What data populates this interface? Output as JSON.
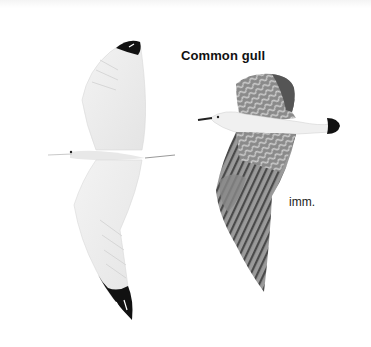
{
  "page": {
    "title": "Common gull",
    "figures": [
      {
        "id": "adult-underside",
        "description": "Gull in flight seen from below, pale wings with black wingtips",
        "icon": "gull-adult-underside-illustration"
      },
      {
        "id": "immature-upperside",
        "description": "Immature gull in flight seen from above, mottled brown-grey wings, black tail band",
        "icon": "gull-immature-upperside-illustration",
        "label": "imm."
      }
    ]
  },
  "colors": {
    "background": "#ffffff",
    "wing_pale": "#ececec",
    "wingtip_black": "#111111",
    "immature_wing": "#7a7a7a",
    "text": "#111111"
  }
}
